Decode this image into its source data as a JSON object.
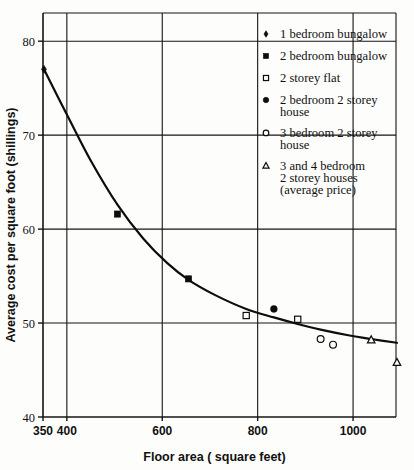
{
  "chart_data": {
    "type": "scatter",
    "title": "",
    "xlabel": "Floor area ( square feet)",
    "ylabel": "Average cost per square foot (shillings)",
    "xlim": [
      350,
      1090
    ],
    "ylim": [
      40,
      83
    ],
    "grid": true,
    "x_ticks": [
      350,
      400,
      600,
      800,
      1000
    ],
    "x_tick_labels": [
      "350",
      "400",
      "600",
      "800",
      "1000"
    ],
    "y_ticks": [
      40,
      50,
      60,
      70,
      80
    ],
    "y_tick_labels": [
      "40",
      "50",
      "60",
      "70",
      "80"
    ],
    "gridlines_x": [
      400,
      600,
      800,
      1000
    ],
    "gridlines_y": [
      50,
      60,
      70,
      80
    ],
    "legend_position": "upper-right-outside",
    "series": [
      {
        "name": "1 bedroom bungalow",
        "marker": "diamond-filled",
        "points": [
          {
            "x": 352,
            "y": 77.0
          }
        ]
      },
      {
        "name": "2 bedroom bungalow",
        "marker": "square-filled",
        "points": [
          {
            "x": 506,
            "y": 61.6
          },
          {
            "x": 655,
            "y": 54.7
          }
        ]
      },
      {
        "name": "2 storey flat",
        "marker": "square-open",
        "points": [
          {
            "x": 776,
            "y": 50.8
          },
          {
            "x": 884,
            "y": 50.4
          }
        ]
      },
      {
        "name": "2 bedroom 2 storey house",
        "marker": "circle-filled",
        "points": [
          {
            "x": 834,
            "y": 51.5
          }
        ]
      },
      {
        "name": "3 bedroom 2 storey house",
        "marker": "circle-open",
        "points": [
          {
            "x": 932,
            "y": 48.3
          },
          {
            "x": 958,
            "y": 47.7
          }
        ]
      },
      {
        "name": "3 and 4 bedroom 2 storey houses (average price)",
        "marker": "triangle-open",
        "points": [
          {
            "x": 1038,
            "y": 48.2
          },
          {
            "x": 1092,
            "y": 45.8
          }
        ]
      }
    ],
    "fitted_curve": [
      {
        "x": 352,
        "y": 77.0
      },
      {
        "x": 400,
        "y": 72.2
      },
      {
        "x": 450,
        "y": 67.3
      },
      {
        "x": 506,
        "y": 62.6
      },
      {
        "x": 560,
        "y": 59.0
      },
      {
        "x": 610,
        "y": 56.4
      },
      {
        "x": 655,
        "y": 54.6
      },
      {
        "x": 710,
        "y": 53.0
      },
      {
        "x": 776,
        "y": 51.5
      },
      {
        "x": 834,
        "y": 50.6
      },
      {
        "x": 884,
        "y": 49.9
      },
      {
        "x": 932,
        "y": 49.3
      },
      {
        "x": 990,
        "y": 48.7
      },
      {
        "x": 1038,
        "y": 48.3
      },
      {
        "x": 1092,
        "y": 47.9
      }
    ]
  },
  "legend": {
    "items": [
      {
        "marker": "diamond-filled",
        "label_lines": [
          "1 bedroom bungalow"
        ]
      },
      {
        "marker": "square-filled",
        "label_lines": [
          "2 bedroom bungalow"
        ]
      },
      {
        "marker": "square-open",
        "label_lines": [
          "2 storey flat"
        ]
      },
      {
        "marker": "circle-filled",
        "label_lines": [
          "2 bedroom 2 storey",
          "house"
        ]
      },
      {
        "marker": "circle-open",
        "label_lines": [
          "3 bedroom 2 storey",
          "house"
        ]
      },
      {
        "marker": "triangle-open",
        "label_lines": [
          "3 and 4 bedroom",
          "2 storey houses",
          "(average price)"
        ]
      }
    ]
  },
  "colors": {
    "ink": "#0d0d0d",
    "paper": "#fdfdfb",
    "grid": "#141414"
  }
}
